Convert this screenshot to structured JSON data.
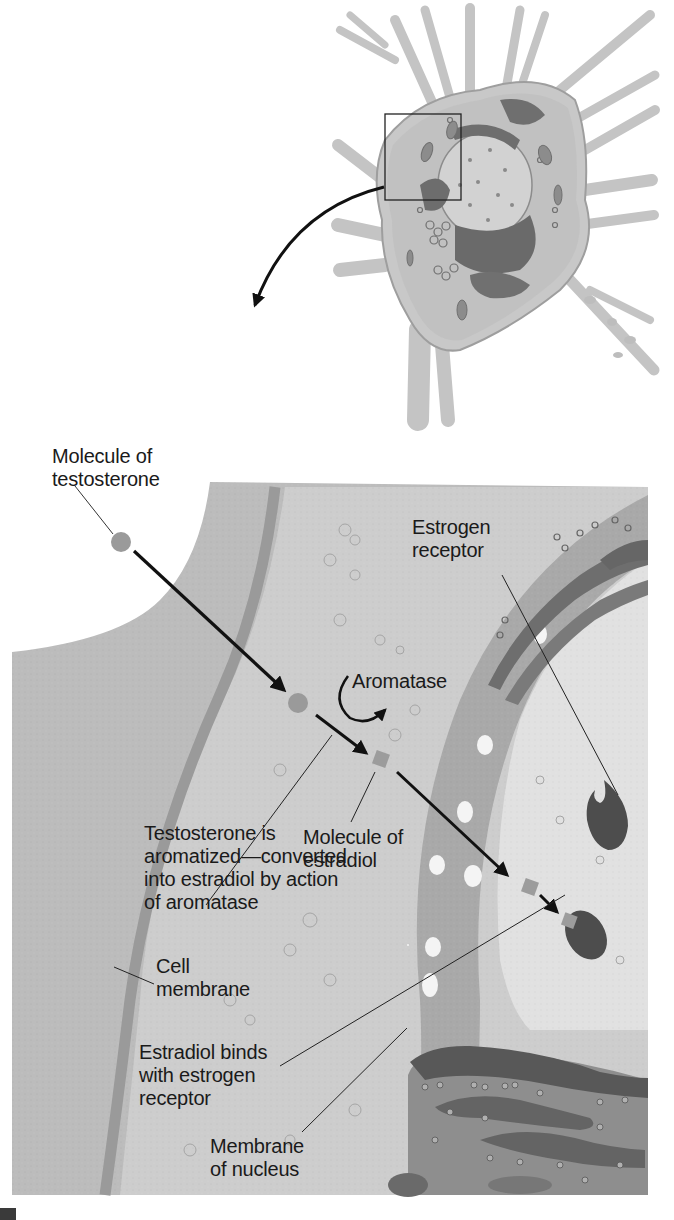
{
  "figure": {
    "type": "biology-diagram",
    "inset": {
      "description": "Neuron cell body with dendrites; a square box highlights the region near the nucleus that is magnified below",
      "highlight_box": true
    },
    "labels": {
      "testosterone_molecule": [
        "Molecule of",
        "testosterone"
      ],
      "estrogen_receptor": [
        "Estrogen",
        "receptor"
      ],
      "aromatase": "Aromatase",
      "estradiol_molecule": [
        "Molecule of",
        "estradiol"
      ],
      "aromatization": [
        "Testosterone is",
        "aromatized—converted",
        "into estradiol by action",
        "of aromatase"
      ],
      "cell_membrane": [
        "Cell",
        "membrane"
      ],
      "estradiol_binds": [
        "Estradiol binds",
        "with estrogen",
        "receptor"
      ],
      "nuclear_membrane": [
        "Membrane",
        "of nucleus"
      ]
    },
    "colors": {
      "background": "#ffffff",
      "cytoplasm": "#b9b9b9",
      "cell_membrane": "#8f8f8f",
      "nuclear_envelope": "#a3a3a3",
      "nucleus_interior": "#dcdcdc",
      "receptor": "#4f4f4f",
      "molecule": "#9a9a9a",
      "arrow": "#111111",
      "text": "#1a1a1a"
    }
  }
}
